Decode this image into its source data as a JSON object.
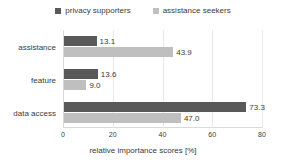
{
  "chart_data": {
    "type": "bar",
    "orientation": "horizontal",
    "title": "",
    "xlabel": "relative importance scores [%]",
    "ylabel": "",
    "categories": [
      "assistance",
      "feature",
      "data access"
    ],
    "series": [
      {
        "name": "privacy supporters",
        "color": "#595959",
        "values": [
          13.1,
          13.6,
          73.3
        ],
        "labels": [
          "13.1",
          "13.6",
          "73.3"
        ]
      },
      {
        "name": "assistance seekers",
        "color": "#bfbfbf",
        "values": [
          43.9,
          9.0,
          47.0
        ],
        "labels": [
          "43.9",
          "9.0",
          "47.0"
        ]
      }
    ],
    "xlim": [
      0,
      80
    ],
    "xticks": [
      0,
      20,
      40,
      60,
      80
    ],
    "xtick_labels": [
      "0",
      "20",
      "40",
      "60",
      "80"
    ],
    "grid": "vertical-light",
    "legend_position": "top-center"
  },
  "legend": {
    "items": [
      {
        "label": "privacy supporters",
        "color": "#595959",
        "marker": "square-swatch"
      },
      {
        "label": "assistance seekers",
        "color": "#bfbfbf",
        "marker": "square-swatch"
      }
    ]
  },
  "axis": {
    "x_title": "relative importance scores [%]",
    "x_ticks": [
      "0",
      "20",
      "40",
      "60",
      "80"
    ],
    "y_categories": [
      "assistance",
      "feature",
      "data access"
    ]
  },
  "values": {
    "assistance": {
      "privacy_supporters": "13.1",
      "assistance_seekers": "43.9"
    },
    "feature": {
      "privacy_supporters": "13.6",
      "assistance_seekers": "9.0"
    },
    "data_access": {
      "privacy_supporters": "73.3",
      "assistance_seekers": "47.0"
    }
  },
  "colors": {
    "series_dark": "#595959",
    "series_light": "#bfbfbf",
    "axis": "#d9d9d9",
    "grid": "#e9e9e9",
    "text": "#3a3a3a",
    "background": "#ffffff"
  }
}
